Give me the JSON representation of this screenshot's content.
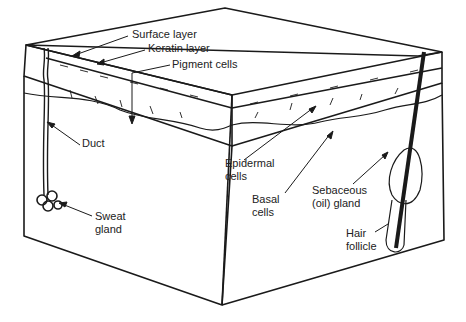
{
  "diagram": {
    "labels": {
      "surface_layer": "Surface layer",
      "keratin_layer": "Keratin layer",
      "pigment_cells": "Pigment cells",
      "duct": "Duct",
      "sweat_gland_1": "Sweat",
      "sweat_gland_2": "gland",
      "epidermal_cells_1": "Epidermal",
      "epidermal_cells_2": "cells",
      "basal_cells_1": "Basal",
      "basal_cells_2": "cells",
      "sebaceous_1": "Sebaceous",
      "sebaceous_2": "(oil) gland",
      "hair_follicle_1": "Hair",
      "hair_follicle_2": "follicle"
    },
    "colors": {
      "ink": "#1a1a1a",
      "paper": "#ffffff"
    }
  }
}
